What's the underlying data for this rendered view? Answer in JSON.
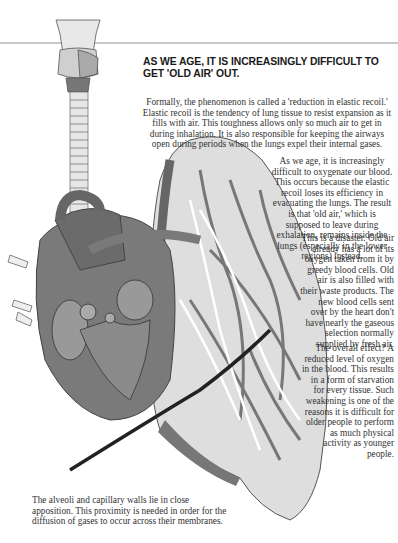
{
  "title": "AS WE AGE, IT IS INCREASINGLY DIFFICULT TO GET 'OLD AIR' OUT.",
  "paragraphs": [
    "Formally, the phenomenon is called a 'reduction in elastic recoil.' Elastic recoil is the tendency of lung tissue to resist expansion as it fills with air. This toughness allows only so much air to get in during inhalation. It is also responsible for keeping the airways open during periods when the lungs expel their internal gases.",
    "As we age, it is increasingly difficult to oxygenate our blood. This occurs because the elastic recoil loses its efficiency in evacuating the lungs. The result is that 'old air,' which is supposed to leave during exhalation, remains inside the lungs (especially in the lower regions) instead.",
    "This is a disaster. Old air already has a lot of its oxygen taken from it by greedy blood cells. Old air is also filled with their waste products. The new blood cells sent over by the heart don't have nearly the gaseous selection normally supplied by fresh air.",
    "The overall effect? A reduced level of oxygen in the blood. This results in a form of starvation for every tissue. Such weakening is one of the reasons it is difficult for older people to perform as much physical activity as younger people."
  ],
  "caption": "The alveoli and capillary walls lie in close apposition. This proximity is needed in order for the diffusion of gases to occur across their membranes.",
  "illustration": {
    "subject": "larynx-trachea-heart-lung-anatomy",
    "colors": {
      "dark": "#5a5a5a",
      "mid": "#8c8c8c",
      "light": "#c8c8c8",
      "pale": "#e4e4e4"
    }
  }
}
